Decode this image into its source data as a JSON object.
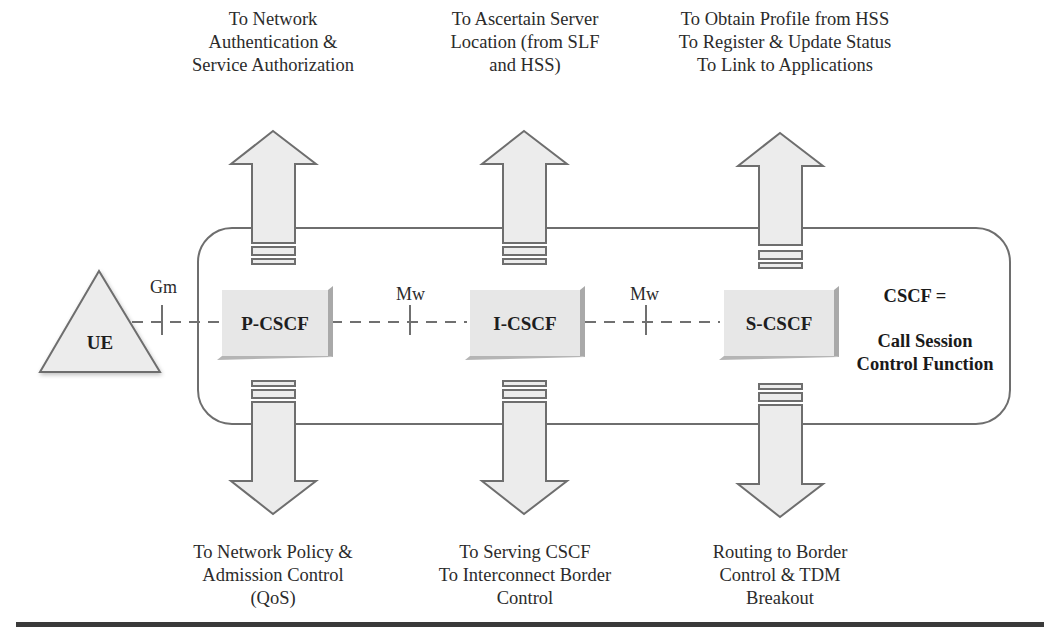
{
  "diagram": {
    "definition": {
      "acronym_line": "CSCF =",
      "expansion_line1": "Call Session",
      "expansion_line2": "Control Function"
    },
    "ue": {
      "label": "UE"
    },
    "interfaces": {
      "ue_to_pcscf": "Gm",
      "pcscf_to_icscf": "Mw",
      "icscf_to_scscf": "Mw"
    },
    "nodes": [
      {
        "id": "p-cscf",
        "label": "P-CSCF",
        "up_text": "To Network\nAuthentication &\nService Authorization",
        "down_text": "To Network Policy &\nAdmission Control\n(QoS)"
      },
      {
        "id": "i-cscf",
        "label": "I-CSCF",
        "up_text": "To Ascertain Server\nLocation (from SLF\nand HSS)",
        "down_text": "To Serving CSCF\nTo Interconnect Border\nControl"
      },
      {
        "id": "s-cscf",
        "label": "S-CSCF",
        "up_text": "To Obtain Profile from HSS\nTo Register & Update Status\nTo Link to Applications",
        "down_text": "Routing to Border\nControl & TDM\nBreakout"
      }
    ],
    "colors": {
      "stroke": "#6e6e6e",
      "fill": "#ececec",
      "node_fill": "#e6e6e6",
      "node_shade": "#a9a9a9",
      "rule": "#3a3a3a"
    }
  }
}
